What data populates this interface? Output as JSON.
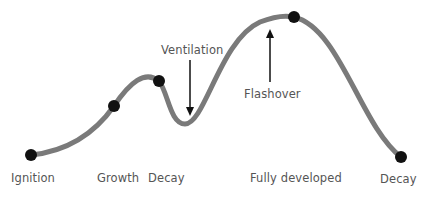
{
  "diagram": {
    "curve_color": "#7a7a7a",
    "point_color": "#111111",
    "arrow_color": "#111111",
    "label_color": "#555555",
    "points": [
      {
        "id": "ignition",
        "x": 31,
        "y": 155
      },
      {
        "id": "growth",
        "x": 114,
        "y": 106
      },
      {
        "id": "decay-1",
        "x": 159,
        "y": 81
      },
      {
        "id": "fully-developed-peak",
        "x": 294,
        "y": 17
      },
      {
        "id": "decay-2",
        "x": 401,
        "y": 157
      }
    ],
    "stage_labels": [
      {
        "text": "Ignition",
        "x": 11,
        "y": 171
      },
      {
        "text": "Growth",
        "x": 97,
        "y": 171
      },
      {
        "text": "Decay",
        "x": 148,
        "y": 171
      },
      {
        "text": "Fully developed",
        "x": 250,
        "y": 171
      },
      {
        "text": "Decay",
        "x": 380,
        "y": 172
      }
    ],
    "annotations": [
      {
        "text": "Ventilation",
        "x": 161,
        "y": 43,
        "arrow": "down"
      },
      {
        "text": "Flashover",
        "x": 244,
        "y": 87,
        "arrow": "up"
      }
    ]
  }
}
